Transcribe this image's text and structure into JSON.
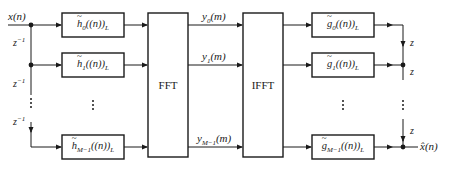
{
  "diagram": {
    "type": "block-diagram",
    "input": {
      "label": "x(n)"
    },
    "output": {
      "label": "x̂(n)"
    },
    "delay_left": {
      "label": "z",
      "exp": "−1"
    },
    "delay_right": {
      "label": "z"
    },
    "analysis_filters": [
      {
        "name": "h",
        "sub": "0",
        "arg": "((n))",
        "subL": "L"
      },
      {
        "name": "h",
        "sub": "1",
        "arg": "((n))",
        "subL": "L"
      },
      {
        "name": "h",
        "sub": "M−1",
        "arg": "((n))",
        "subL": "L"
      }
    ],
    "fft": {
      "label": "FFT"
    },
    "ifft": {
      "label": "IFFT"
    },
    "signals": [
      {
        "name": "y",
        "sub": "0",
        "arg": "(m)"
      },
      {
        "name": "y",
        "sub": "1",
        "arg": "(m)"
      },
      {
        "name": "y",
        "sub": "M−1",
        "arg": "(m)"
      }
    ],
    "synthesis_filters": [
      {
        "name": "g",
        "sub": "0",
        "arg": "((n))",
        "subL": "L"
      },
      {
        "name": "g",
        "sub": "1",
        "arg": "((n))",
        "subL": "L"
      },
      {
        "name": "g",
        "sub": "M−1",
        "arg": "((n))",
        "subL": "L"
      }
    ],
    "ellipsis": "⋮"
  }
}
